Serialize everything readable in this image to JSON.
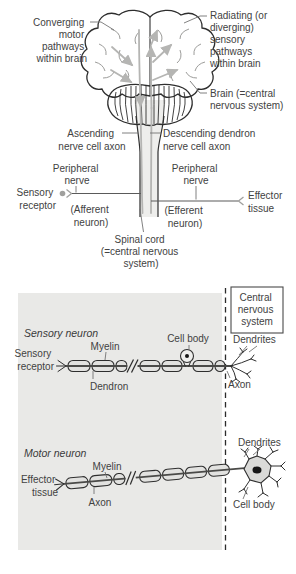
{
  "colors": {
    "panel_bg": "#e9e9e7",
    "diagram_line": "#2e2e2e",
    "pathway_gray": "#b5b5b3",
    "text": "#424242"
  },
  "top_figure": {
    "converging": {
      "lines": [
        "Converging",
        "motor",
        "pathways",
        "within brain"
      ]
    },
    "radiating": {
      "lines": [
        "Radiating (or",
        "diverging)",
        "sensory",
        "pathways",
        "within brain"
      ]
    },
    "brain": {
      "lines": [
        "Brain (=central",
        "nervous system)"
      ]
    },
    "ascending": {
      "lines": [
        "Ascending",
        "nerve cell axon"
      ]
    },
    "descending": {
      "lines": [
        "Descending dendron",
        "nerve cell axon"
      ]
    },
    "peripheral_left": {
      "lines": [
        "Peripheral",
        "nerve"
      ]
    },
    "peripheral_right": {
      "lines": [
        "Peripheral",
        "nerve"
      ]
    },
    "sensory_receptor": {
      "lines": [
        "Sensory",
        "receptor"
      ]
    },
    "afferent": {
      "lines": [
        "(Afferent",
        "neuron)"
      ]
    },
    "efferent": {
      "lines": [
        "(Efferent",
        "neuron)"
      ]
    },
    "effector_tissue": {
      "lines": [
        "Effector",
        "tissue"
      ]
    },
    "spinal_cord": {
      "lines": [
        "Spinal cord",
        "(=central nervous",
        "system)"
      ]
    }
  },
  "bottom_figure": {
    "cns_box": {
      "lines": [
        "Central",
        "nervous",
        "system"
      ]
    },
    "sensory": {
      "title": "Sensory neuron",
      "receptor": {
        "lines": [
          "Sensory",
          "receptor"
        ]
      },
      "myelin": "Myelin",
      "dendron": "Dendron",
      "cell_body": "Cell body",
      "dendrites": "Dendrites",
      "axon": "Axon"
    },
    "motor": {
      "title": "Motor neuron",
      "effector": {
        "lines": [
          "Effector",
          "tissue"
        ]
      },
      "myelin": "Myelin",
      "axon": "Axon",
      "dendrites": "Dendrites",
      "cell_body": "Cell body"
    }
  }
}
